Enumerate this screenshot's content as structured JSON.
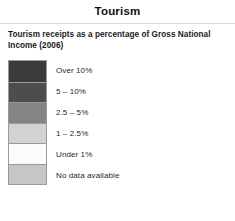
{
  "header": {
    "title": "Tourism",
    "subtitle": "Tourism receipts as a percentage of Gross National Income (2006)"
  },
  "legend": {
    "items": [
      {
        "label": "Over 10%",
        "color": "#3b3b3b"
      },
      {
        "label": "5 – 10%",
        "color": "#4d4d4d"
      },
      {
        "label": "2.5 – 5%",
        "color": "#848484"
      },
      {
        "label": "1 – 2.5%",
        "color": "#d2d2d2"
      },
      {
        "label": "Under 1%",
        "color": "#fbfbfb"
      },
      {
        "label": "No data available",
        "color": "#c6c6c6"
      }
    ]
  }
}
